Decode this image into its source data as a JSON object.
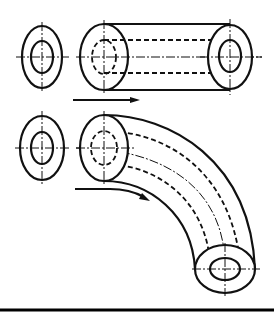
{
  "figure": {
    "line_color": "#111111",
    "background": "#ffffff"
  },
  "views": [
    {
      "id": "top-profile",
      "type": "ring-profile",
      "cx": 42,
      "cy": 57,
      "outer": [
        20,
        31
      ],
      "inner": [
        11,
        16
      ]
    },
    {
      "id": "top-cylinder",
      "type": "straight-extrusion",
      "start": [
        104,
        57
      ],
      "end": [
        230,
        57
      ]
    },
    {
      "id": "bottom-profile",
      "type": "ring-profile",
      "cx": 42,
      "cy": 148,
      "outer": [
        22,
        32
      ],
      "inner": [
        11,
        16
      ]
    },
    {
      "id": "bottom-bend",
      "type": "curved-sweep",
      "start": [
        104,
        148
      ],
      "end": [
        225,
        269
      ]
    }
  ],
  "arrows": [
    {
      "id": "straight-arrow",
      "direction": "right",
      "meaning": "linear sweep path"
    },
    {
      "id": "curved-arrow",
      "direction": "right-down",
      "meaning": "curved sweep path"
    }
  ]
}
